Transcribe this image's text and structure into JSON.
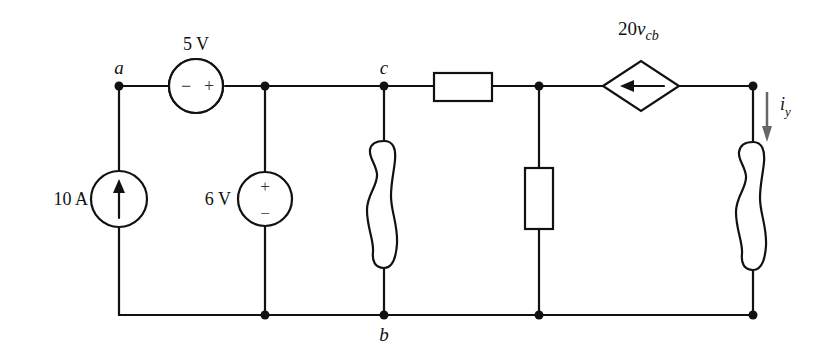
{
  "diagram": {
    "type": "electrical-circuit",
    "nodes": {
      "a": "a",
      "b": "b",
      "c": "c"
    },
    "components": {
      "current_source": {
        "label": "10 A",
        "direction": "up"
      },
      "series_voltage_source": {
        "label": "5 V",
        "minus": "−",
        "plus": "+"
      },
      "shunt_voltage_source": {
        "label": "6 V",
        "plus": "+",
        "minus": "−"
      },
      "dependent_source": {
        "label_main": "20",
        "label_var": "v",
        "label_sub": "cb",
        "direction": "left"
      },
      "current_label": {
        "main": "i",
        "sub": "y"
      }
    }
  }
}
